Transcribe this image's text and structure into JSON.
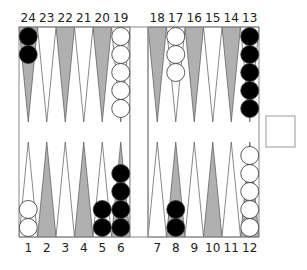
{
  "board": {
    "colors": {
      "light_point": "#ffffff",
      "dark_point": "#b0b0b0",
      "point_stroke": "#555555",
      "frame": "#888888",
      "black_checker": "#000000",
      "white_checker": "#ffffff",
      "checker_stroke": "#333333"
    },
    "top_labels": [
      "24",
      "23",
      "22",
      "21",
      "20",
      "19",
      "18",
      "17",
      "16",
      "15",
      "14",
      "13"
    ],
    "bottom_labels": [
      "1",
      "2",
      "3",
      "4",
      "5",
      "6",
      "7",
      "8",
      "9",
      "10",
      "11",
      "12"
    ],
    "points": [
      {
        "point": 1,
        "row": "bottom",
        "shade": "light",
        "checkers": {
          "color": "white",
          "count": 2
        }
      },
      {
        "point": 2,
        "row": "bottom",
        "shade": "dark",
        "checkers": {
          "color": null,
          "count": 0
        }
      },
      {
        "point": 3,
        "row": "bottom",
        "shade": "light",
        "checkers": {
          "color": null,
          "count": 0
        }
      },
      {
        "point": 4,
        "row": "bottom",
        "shade": "dark",
        "checkers": {
          "color": null,
          "count": 0
        }
      },
      {
        "point": 5,
        "row": "bottom",
        "shade": "light",
        "checkers": {
          "color": "black",
          "count": 2
        }
      },
      {
        "point": 6,
        "row": "bottom",
        "shade": "dark",
        "checkers": {
          "color": "black",
          "count": 4
        }
      },
      {
        "point": 7,
        "row": "bottom",
        "shade": "light",
        "checkers": {
          "color": null,
          "count": 0
        }
      },
      {
        "point": 8,
        "row": "bottom",
        "shade": "dark",
        "checkers": {
          "color": "black",
          "count": 2
        }
      },
      {
        "point": 9,
        "row": "bottom",
        "shade": "light",
        "checkers": {
          "color": null,
          "count": 0
        }
      },
      {
        "point": 10,
        "row": "bottom",
        "shade": "dark",
        "checkers": {
          "color": null,
          "count": 0
        }
      },
      {
        "point": 11,
        "row": "bottom",
        "shade": "light",
        "checkers": {
          "color": null,
          "count": 0
        }
      },
      {
        "point": 12,
        "row": "bottom",
        "shade": "dark",
        "checkers": {
          "color": "white",
          "count": 5
        }
      },
      {
        "point": 13,
        "row": "top",
        "shade": "light",
        "checkers": {
          "color": "black",
          "count": 5
        }
      },
      {
        "point": 14,
        "row": "top",
        "shade": "dark",
        "checkers": {
          "color": null,
          "count": 0
        }
      },
      {
        "point": 15,
        "row": "top",
        "shade": "light",
        "checkers": {
          "color": null,
          "count": 0
        }
      },
      {
        "point": 16,
        "row": "top",
        "shade": "dark",
        "checkers": {
          "color": null,
          "count": 0
        }
      },
      {
        "point": 17,
        "row": "top",
        "shade": "light",
        "checkers": {
          "color": "white",
          "count": 3
        }
      },
      {
        "point": 18,
        "row": "top",
        "shade": "dark",
        "checkers": {
          "color": null,
          "count": 0
        }
      },
      {
        "point": 19,
        "row": "top",
        "shade": "light",
        "checkers": {
          "color": "white",
          "count": 5
        }
      },
      {
        "point": 20,
        "row": "top",
        "shade": "dark",
        "checkers": {
          "color": null,
          "count": 0
        }
      },
      {
        "point": 21,
        "row": "top",
        "shade": "light",
        "checkers": {
          "color": null,
          "count": 0
        }
      },
      {
        "point": 22,
        "row": "top",
        "shade": "dark",
        "checkers": {
          "color": null,
          "count": 0
        }
      },
      {
        "point": 23,
        "row": "top",
        "shade": "light",
        "checkers": {
          "color": null,
          "count": 0
        }
      },
      {
        "point": 24,
        "row": "top",
        "shade": "dark",
        "checkers": {
          "color": "black",
          "count": 2
        }
      }
    ],
    "bar": {
      "black": 0,
      "white": 0
    },
    "doubling_cube": {
      "value": ""
    }
  }
}
